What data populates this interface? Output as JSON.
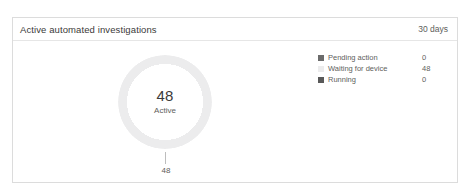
{
  "card": {
    "title": "Active automated investigations",
    "period": "30 days"
  },
  "chart_data": {
    "type": "pie",
    "title": "Active automated investigations",
    "center_value": "48",
    "center_label": "Active",
    "callout_value": "48",
    "legend_position": "right",
    "categories": [
      "Pending action",
      "Waiting for device",
      "Running"
    ],
    "values": [
      0,
      48,
      0
    ],
    "colors": [
      "#6b6b6b",
      "#ececed",
      "#595959"
    ],
    "total": 48
  },
  "legend": {
    "rows": [
      {
        "label": "Pending action",
        "count": "0",
        "color": "#6b6b6b"
      },
      {
        "label": "Waiting for device",
        "count": "48",
        "color": "#ececed"
      },
      {
        "label": "Running",
        "count": "0",
        "color": "#595959"
      }
    ]
  },
  "colors": {
    "card_border": "#dcdcdc",
    "divider": "#e6e6e6",
    "ring": "#ececed",
    "text_primary": "#3b3a39",
    "text_secondary": "#605e5c"
  }
}
